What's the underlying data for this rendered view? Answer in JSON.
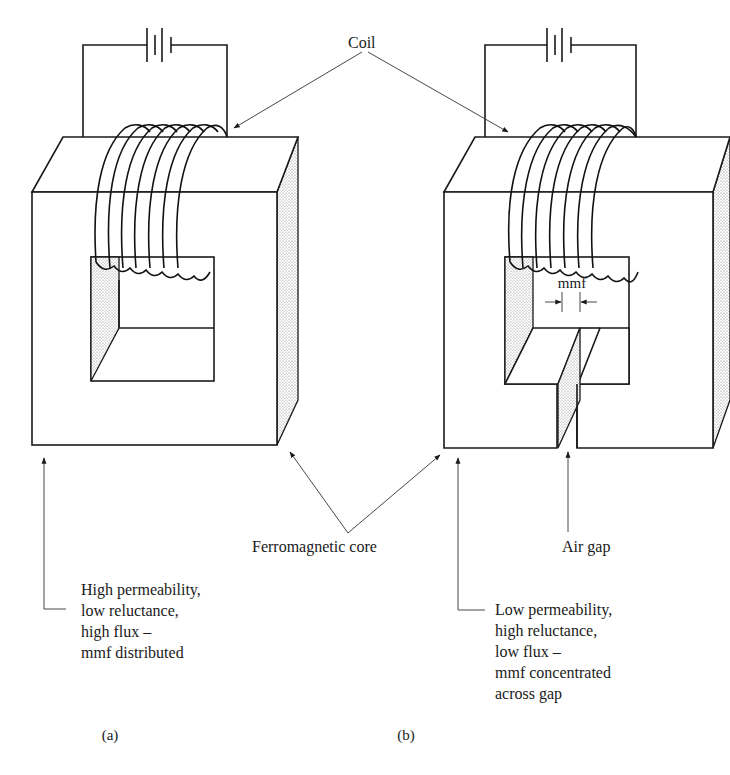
{
  "labels": {
    "coil": "Coil",
    "ferromagnetic_core": "Ferromagnetic core",
    "air_gap": "Air gap",
    "mmf": "mmf"
  },
  "panel_a": {
    "caption": "(a)",
    "description": [
      "High permeability,",
      "low reluctance,",
      "high flux –",
      "mmf distributed"
    ]
  },
  "panel_b": {
    "caption": "(b)",
    "description": [
      "Low permeability,",
      "high reluctance,",
      "low flux –",
      "mmf concentrated",
      "across gap"
    ]
  },
  "colors": {
    "ink": "#1a1a1a",
    "background": "#ffffff",
    "shading": "#9a9a9a"
  }
}
